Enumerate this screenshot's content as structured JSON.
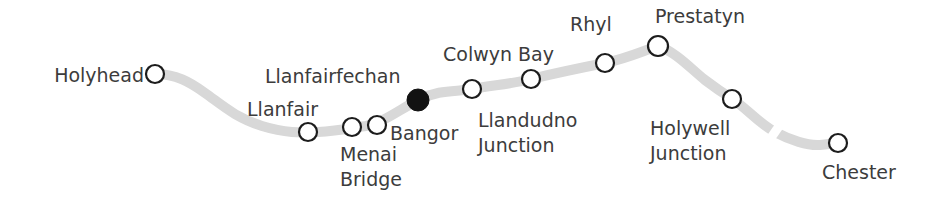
{
  "diagram": {
    "track_color": "#d8d8d8",
    "track_width": 10,
    "marker_stroke_color": "#1c1c1c",
    "marker_fill_color": "#ffffff",
    "marker_filled_color": "#121212",
    "label_color": "#3c3c3c",
    "background_color": "#ffffff"
  },
  "chart_data": {
    "type": "diagram",
    "xlabel": "",
    "ylabel": "",
    "track_path": "M 155 74 C 176 74 190 82 205 93 C 222 105 236 118 262 126 C 285 133 300 133 318 132 C 336 131 352 128 366 126 C 382 123 396 112 418 100 C 440 89 456 92 472 89 C 494 85 512 84 531 79 C 556 73 580 68 605 63 C 628 58 640 52 658 46 C 676 52 690 68 705 80 C 718 90 726 95 734 100 C 748 110 760 124 775 132 C 790 140 808 146 820 145 C 830 144 834 143 838 143",
    "track_break": {
      "x": 775,
      "y": 132,
      "width": 9
    },
    "stations": [
      {
        "name": "Holyhead",
        "x": 155,
        "y": 74,
        "r": 9,
        "filled": false,
        "label": "Holyhead",
        "label_x": 144,
        "label_y": 63,
        "align": "end",
        "lines": [
          "Holyhead"
        ]
      },
      {
        "name": "Llanfair",
        "x": 308,
        "y": 132,
        "r": 9,
        "filled": false,
        "label": "Llanfair",
        "label_x": 318,
        "label_y": 97,
        "align": "end",
        "lines": [
          "Llanfair"
        ]
      },
      {
        "name": "Menai Bridge",
        "x": 352,
        "y": 127,
        "r": 9,
        "filled": false,
        "label": "Menai Bridge",
        "label_x": 340,
        "label_y": 142,
        "align": "start",
        "lines": [
          "Menai",
          "Bridge"
        ]
      },
      {
        "name": "Llanfairfechan",
        "x": 377,
        "y": 125,
        "r": 9,
        "filled": false,
        "label": "Llanfairfechan",
        "label_x": 265,
        "label_y": 64,
        "align": "start",
        "lines": [
          "Llanfairfechan"
        ]
      },
      {
        "name": "Bangor",
        "x": 418,
        "y": 100,
        "r": 11,
        "filled": true,
        "label": "Bangor",
        "label_x": 390,
        "label_y": 121,
        "align": "start",
        "lines": [
          "Bangor"
        ]
      },
      {
        "name": "Llandudno Junction",
        "x": 472,
        "y": 89,
        "r": 9,
        "filled": false,
        "label": "Llandudno Junction",
        "label_x": 478,
        "label_y": 108,
        "align": "start",
        "lines": [
          "Llandudno",
          "Junction"
        ]
      },
      {
        "name": "Colwyn Bay",
        "x": 531,
        "y": 79,
        "r": 9,
        "filled": false,
        "label": "Colwyn Bay",
        "label_x": 443,
        "label_y": 42,
        "align": "start",
        "lines": [
          "Colwyn Bay"
        ]
      },
      {
        "name": "Rhyl",
        "x": 605,
        "y": 63,
        "r": 9,
        "filled": false,
        "label": "Rhyl",
        "label_x": 570,
        "label_y": 12,
        "align": "start",
        "lines": [
          "Rhyl"
        ]
      },
      {
        "name": "Prestatyn",
        "x": 658,
        "y": 46,
        "r": 10,
        "filled": false,
        "label": "Prestatyn",
        "label_x": 655,
        "label_y": 4,
        "align": "start",
        "lines": [
          "Prestatyn"
        ]
      },
      {
        "name": "Holywell Junction",
        "x": 732,
        "y": 99,
        "r": 9,
        "filled": false,
        "label": "Holywell Junction",
        "label_x": 650,
        "label_y": 116,
        "align": "start",
        "lines": [
          "Holywell",
          "Junction"
        ]
      },
      {
        "name": "Chester",
        "x": 838,
        "y": 143,
        "r": 9,
        "filled": false,
        "label": "Chester",
        "label_x": 822,
        "label_y": 160,
        "align": "start",
        "lines": [
          "Chester"
        ]
      }
    ],
    "legend": [],
    "annotations": [],
    "grid": false
  }
}
